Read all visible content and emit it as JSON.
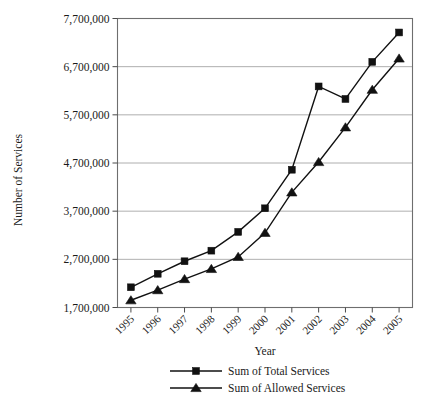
{
  "chart_data": {
    "type": "line",
    "title": "",
    "xlabel": "Year",
    "ylabel": "Number of Services",
    "categories": [
      "1995",
      "1996",
      "1997",
      "1998",
      "1999",
      "2000",
      "2001",
      "2002",
      "2003",
      "2004",
      "2005"
    ],
    "series": [
      {
        "name": "Sum of Total Services",
        "marker": "square",
        "color": "#111111",
        "values": [
          2120000,
          2400000,
          2660000,
          2880000,
          3270000,
          3760000,
          4560000,
          6290000,
          6030000,
          6800000,
          7410000
        ]
      },
      {
        "name": "Sum of Allowed Services",
        "marker": "triangle",
        "color": "#111111",
        "values": [
          1850000,
          2060000,
          2290000,
          2500000,
          2750000,
          3250000,
          4090000,
          4720000,
          5440000,
          6220000,
          6870000
        ]
      }
    ],
    "ylim": [
      1700000,
      7700000
    ],
    "ytick_values": [
      1700000,
      2700000,
      3700000,
      4700000,
      5700000,
      6700000,
      7700000
    ],
    "ytick_labels": [
      "1,700,000",
      "2,700,000",
      "3,700,000",
      "4,700,000",
      "5,700,000",
      "6,700,000",
      "7,700,000"
    ],
    "grid": true,
    "grid_axis": "y",
    "legend_position": "bottom",
    "x_tick_rotation": "45"
  },
  "legend": {
    "items": [
      {
        "label": "Sum of Total Services",
        "marker": "square"
      },
      {
        "label": "Sum of Allowed Services",
        "marker": "triangle"
      }
    ]
  }
}
